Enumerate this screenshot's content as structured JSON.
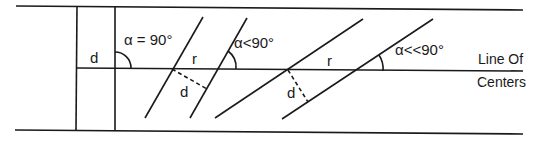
{
  "diagram": {
    "labels": {
      "d_left": "d",
      "alpha_90": "α = 90°",
      "r_middle": "r",
      "alpha_lt": "α<90°",
      "d_middle": "d",
      "r_right": "r",
      "alpha_llt": "α<<90°",
      "d_right": "d",
      "line_of": "Line Of",
      "centers": "Centers"
    },
    "colors": {
      "ink": "#1a1a1a",
      "background": "#ffffff"
    }
  }
}
